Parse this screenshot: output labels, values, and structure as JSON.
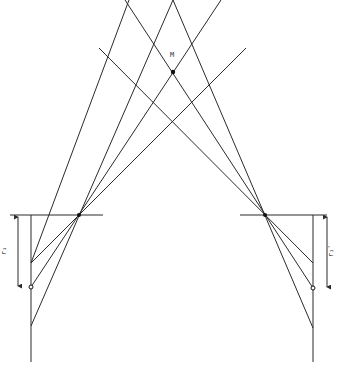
{
  "diagram": {
    "width": 337,
    "height": 374,
    "stroke_color": "#2a2a2a",
    "point_M": {
      "label": "M",
      "x": 173,
      "y": 72,
      "label_x": 170,
      "label_y": 57
    },
    "lines": [
      {
        "id": "left-outer",
        "x1": 129,
        "y1": 0,
        "x2": 31,
        "y2": 263
      },
      {
        "id": "left-mid",
        "x1": 173,
        "y1": 0,
        "x2": 31,
        "y2": 326
      },
      {
        "id": "left-center",
        "x1": 221,
        "y1": 0,
        "x2": 31,
        "y2": 287
      },
      {
        "id": "left-shallow",
        "x1": 246,
        "y1": 48,
        "x2": 31,
        "y2": 263
      },
      {
        "id": "right-outer",
        "x1": 125,
        "y1": 0,
        "x2": 313,
        "y2": 288
      },
      {
        "id": "right-mid",
        "x1": 173,
        "y1": 0,
        "x2": 313,
        "y2": 328
      },
      {
        "id": "right-shallow",
        "x1": 99,
        "y1": 48,
        "x2": 313,
        "y2": 263
      }
    ],
    "left_station": {
      "pivot": {
        "x": 79,
        "y": 215
      },
      "horizontal": {
        "x1": 10,
        "x2": 103,
        "y": 215
      },
      "vertical": {
        "x": 31,
        "y1": 215,
        "y2": 362
      },
      "circle": {
        "x": 31,
        "y": 287
      },
      "arrow": {
        "x": 18,
        "y1": 217,
        "y2": 286
      },
      "label": {
        "text": "r₁",
        "x": 6,
        "y": 251
      }
    },
    "right_station": {
      "pivot": {
        "x": 265,
        "y": 215
      },
      "horizontal": {
        "x1": 240,
        "x2": 327,
        "y": 215
      },
      "vertical": {
        "x": 313,
        "y1": 215,
        "y2": 362
      },
      "circle": {
        "x": 313,
        "y": 288
      },
      "arrow": {
        "x": 327,
        "y1": 217,
        "y2": 287
      },
      "label": {
        "text": "r₁'",
        "x": 333,
        "y": 251
      }
    }
  }
}
